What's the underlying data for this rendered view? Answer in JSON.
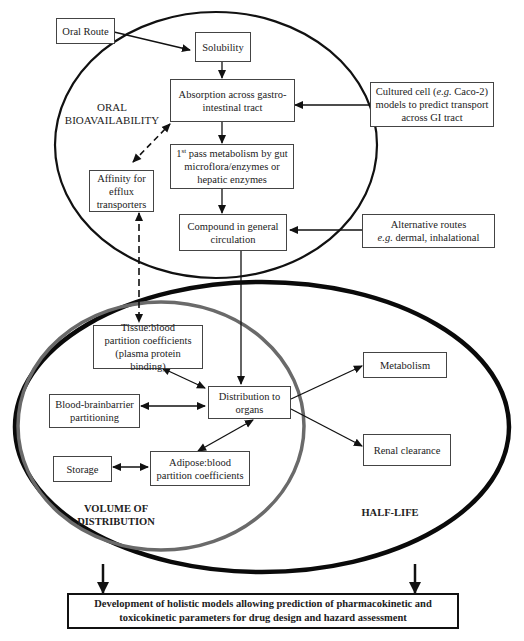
{
  "diagram": {
    "type": "flowchart",
    "regions": {
      "oral_bioavailability": "ORAL\nBIOAVAILABILITY",
      "volume_of_distribution": "VOLUME OF\nDISTRIBUTION",
      "half_life": "HALF-LIFE"
    },
    "region_labels": {
      "oral_line1": "ORAL",
      "oral_line2": "BIOAVAILABILITY",
      "volume_line1": "VOLUME OF",
      "volume_line2": "DISTRIBUTION",
      "half_life": "HALF-LIFE"
    },
    "nodes": {
      "oral_route": "Oral Route",
      "solubility": "Solubility",
      "absorption_line1": "Absorption across gastro-",
      "absorption_line2": "intestinal tract",
      "first_pass_sup_prefix": "1",
      "first_pass_sup": "st",
      "first_pass_line1_rest": " pass metabolism by gut",
      "first_pass_line2": "microflora/enzymes or",
      "first_pass_line3": "hepatic enzymes",
      "affinity_line1": "Affinity for",
      "affinity_line2": "efflux",
      "affinity_line3": "transporters",
      "compound_line1": "Compound in general",
      "compound_line2": "circulation",
      "cultured_prefix": "Cultured cell (",
      "cultured_eg": "e.g.",
      "cultured_suffix": " Caco-2)",
      "cultured_line2": "models to predict transport",
      "cultured_line3": "across GI tract",
      "alternative_line1": "Alternative routes",
      "alternative_eg": "e.g.",
      "alternative_line2_rest": " dermal, inhalational",
      "tissue_line1": "Tissue:blood",
      "tissue_line2": "partition coefficients",
      "tissue_line3": "(plasma protein binding)",
      "distribution_line1": "Distribution to",
      "distribution_line2": "organs",
      "bbb_line1": "Blood-brainbarrier",
      "bbb_line2": "partitioning",
      "storage": "Storage",
      "adipose_line1": "Adipose:blood",
      "adipose_line2": "partition coefficients",
      "metabolism": "Metabolism",
      "renal": "Renal clearance"
    },
    "final": {
      "line1": "Development of holistic models allowing prediction of pharmacokinetic and",
      "line2": "toxicokinetic parameters for drug design and hazard assessment"
    },
    "edges": [
      {
        "from": "Oral Route",
        "to": "Solubility",
        "style": "solid"
      },
      {
        "from": "Solubility",
        "to": "Absorption across gastro-intestinal tract",
        "style": "solid"
      },
      {
        "from": "Absorption across gastro-intestinal tract",
        "to": "1st pass metabolism",
        "style": "solid"
      },
      {
        "from": "1st pass metabolism",
        "to": "Compound in general circulation",
        "style": "solid"
      },
      {
        "from": "Cultured cell models",
        "to": "Absorption across gastro-intestinal tract",
        "style": "solid"
      },
      {
        "from": "Alternative routes",
        "to": "Compound in general circulation",
        "style": "solid"
      },
      {
        "from": "Affinity for efflux transporters",
        "to": "Absorption across gastro-intestinal tract",
        "style": "dashed"
      },
      {
        "from": "Affinity for efflux transporters",
        "to": "Tissue:blood partition coefficients",
        "style": "dashed",
        "bidirectional": true
      },
      {
        "from": "Compound in general circulation",
        "to": "Distribution to organs",
        "style": "solid"
      },
      {
        "from": "Tissue:blood partition coefficients",
        "to": "Distribution to organs",
        "style": "solid",
        "bidirectional": true
      },
      {
        "from": "Blood-brainbarrier partitioning",
        "to": "Distribution to organs",
        "style": "solid",
        "bidirectional": true
      },
      {
        "from": "Adipose:blood partition coefficients",
        "to": "Distribution to organs",
        "style": "solid",
        "bidirectional": true
      },
      {
        "from": "Storage",
        "to": "Adipose:blood partition coefficients",
        "style": "solid",
        "bidirectional": true
      },
      {
        "from": "Distribution to organs",
        "to": "Metabolism",
        "style": "solid"
      },
      {
        "from": "Distribution to organs",
        "to": "Renal clearance",
        "style": "solid"
      },
      {
        "from": "VOLUME OF DISTRIBUTION",
        "to": "Development of holistic models",
        "style": "solid"
      },
      {
        "from": "HALF-LIFE",
        "to": "Development of holistic models",
        "style": "solid"
      }
    ],
    "colors": {
      "ellipse_oral": "#111111",
      "ellipse_half_life": "#0a0a0a",
      "ellipse_volume": "#6a6a6a",
      "box_border": "#444444"
    }
  }
}
